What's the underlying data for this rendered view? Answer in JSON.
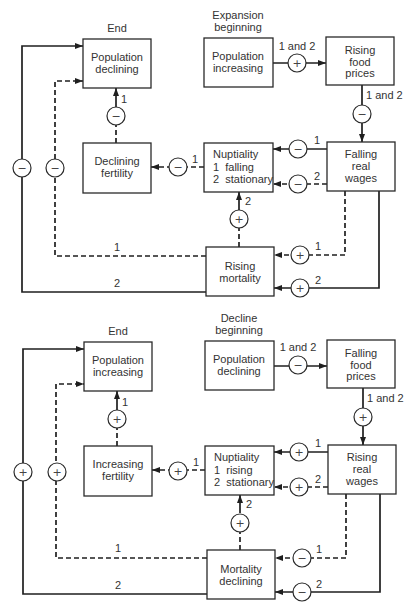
{
  "figure": {
    "diagrams": [
      {
        "phase_label": {
          "line1": "Expansion",
          "line2": "beginning"
        },
        "end_label": "End",
        "boxes": {
          "population_end": {
            "line1": "Population",
            "line2": "declining"
          },
          "population_start": {
            "line1": "Population",
            "line2": "increasing"
          },
          "food_prices": {
            "line1": "Rising",
            "line2": "food",
            "line3": "prices"
          },
          "real_wages": {
            "line1": "Falling",
            "line2": "real",
            "line3": "wages"
          },
          "nuptiality": {
            "line1": "Nuptiality",
            "line2": "1  falling",
            "line3": "2  stationary"
          },
          "fertility": {
            "line1": "Declining",
            "line2": "fertility"
          },
          "mortality": {
            "line1": "Rising",
            "line2": "mortality"
          }
        },
        "links": {
          "population_to_food": {
            "sign": "+",
            "label": "1 and 2",
            "style": "solid"
          },
          "food_to_wages": {
            "sign": "−",
            "label": "1 and 2",
            "style": "solid"
          },
          "wages_to_nuptiality_1": {
            "sign": "−",
            "label": "1",
            "style": "solid"
          },
          "wages_to_nuptiality_2": {
            "sign": "−",
            "label": "2",
            "style": "dashed"
          },
          "nuptiality_to_fertility": {
            "sign": "−",
            "label": "1",
            "style": "dashed"
          },
          "fertility_to_population": {
            "sign": "−",
            "label": "1",
            "style": "dashed"
          },
          "mortality_to_nuptiality": {
            "sign": "+",
            "label": "2",
            "style": "dashed"
          },
          "wages_to_mortality_1": {
            "sign": "+",
            "label": "1",
            "style": "dashed"
          },
          "wages_to_mortality_2": {
            "sign": "+",
            "label": "2",
            "style": "solid"
          },
          "mortality_to_population_1": {
            "sign": "−",
            "label": "1",
            "style": "dashed"
          },
          "mortality_to_population_2": {
            "sign": "−",
            "label": "2",
            "style": "solid"
          }
        }
      },
      {
        "phase_label": {
          "line1": "Decline",
          "line2": "beginning"
        },
        "end_label": "End",
        "boxes": {
          "population_end": {
            "line1": "Population",
            "line2": "increasing"
          },
          "population_start": {
            "line1": "Population",
            "line2": "declining"
          },
          "food_prices": {
            "line1": "Falling",
            "line2": "food",
            "line3": "prices"
          },
          "real_wages": {
            "line1": "Rising",
            "line2": "real",
            "line3": "wages"
          },
          "nuptiality": {
            "line1": "Nuptiality",
            "line2": "1  rising",
            "line3": "2  stationary"
          },
          "fertility": {
            "line1": "Increasing",
            "line2": "fertility"
          },
          "mortality": {
            "line1": "Mortality",
            "line2": "declining"
          }
        },
        "links": {
          "population_to_food": {
            "sign": "−",
            "label": "1 and 2",
            "style": "solid"
          },
          "food_to_wages": {
            "sign": "+",
            "label": "1 and 2",
            "style": "solid"
          },
          "wages_to_nuptiality_1": {
            "sign": "+",
            "label": "1",
            "style": "solid"
          },
          "wages_to_nuptiality_2": {
            "sign": "+",
            "label": "2",
            "style": "dashed"
          },
          "nuptiality_to_fertility": {
            "sign": "+",
            "label": "1",
            "style": "dashed"
          },
          "fertility_to_population": {
            "sign": "+",
            "label": "1",
            "style": "dashed"
          },
          "mortality_to_nuptiality": {
            "sign": "+",
            "label": "2",
            "style": "dashed"
          },
          "wages_to_mortality_1": {
            "sign": "−",
            "label": "1",
            "style": "dashed"
          },
          "wages_to_mortality_2": {
            "sign": "−",
            "label": "2",
            "style": "solid"
          },
          "mortality_to_population_1": {
            "sign": "+",
            "label": "1",
            "style": "dashed"
          },
          "mortality_to_population_2": {
            "sign": "+",
            "label": "2",
            "style": "solid"
          }
        }
      }
    ]
  }
}
